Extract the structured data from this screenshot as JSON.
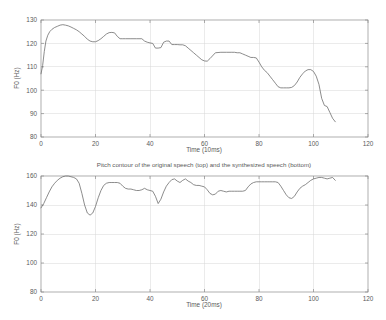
{
  "figure": {
    "title": "Pitch contour of the original speech (top) and the synthesized speech (bottom)",
    "background": "#ffffff",
    "line_color": "#6e6e6e",
    "axis_color": "#8c8c8c"
  },
  "chart_data": [
    {
      "type": "line",
      "id": "original-speech-pitch-contour",
      "title": "",
      "xlabel": "Time (10ms)",
      "ylabel": "F0 (Hz)",
      "xlim": [
        0,
        120
      ],
      "ylim": [
        80,
        130
      ],
      "xticks": [
        0,
        20,
        40,
        60,
        80,
        100,
        120
      ],
      "yticks": [
        80,
        90,
        100,
        110,
        120,
        130
      ],
      "grid": true,
      "legend": "none",
      "series": [
        {
          "name": "original speech F0",
          "x": [
            0,
            0.6,
            1.2,
            1.8,
            2.5,
            3.2,
            4,
            5,
            6,
            7,
            8,
            9,
            10,
            11,
            12,
            13,
            14,
            15,
            16,
            17,
            18,
            19,
            20,
            21,
            22,
            23,
            24,
            25,
            26,
            27,
            28,
            29,
            30,
            31,
            33,
            35,
            37,
            38,
            39,
            40,
            41,
            42,
            43,
            44,
            45,
            46,
            47,
            48,
            49,
            50,
            51,
            52,
            53,
            54,
            55,
            56,
            57,
            58,
            59,
            60,
            61,
            62,
            64,
            66,
            68,
            70,
            71,
            72,
            73,
            74,
            75,
            76,
            77,
            78,
            79,
            80,
            81,
            82,
            83,
            84,
            85,
            86,
            87,
            88,
            89,
            90,
            91,
            92,
            93,
            94,
            95,
            96,
            97,
            98,
            99,
            100,
            101,
            102,
            103,
            104,
            105,
            106,
            107,
            108
          ],
          "y": [
            107.0,
            110.5,
            116.5,
            121.0,
            123.5,
            125.0,
            126.0,
            126.8,
            127.3,
            127.8,
            128.0,
            127.8,
            127.5,
            127.0,
            126.4,
            125.8,
            125.0,
            124.0,
            123.0,
            121.8,
            121.0,
            120.7,
            120.7,
            121.2,
            122.0,
            123.0,
            124.0,
            124.6,
            124.7,
            124.5,
            123.0,
            122.0,
            122.0,
            122.0,
            122.0,
            122.0,
            122.0,
            121.0,
            120.5,
            120.2,
            120.0,
            118.0,
            118.0,
            118.2,
            120.5,
            121.0,
            121.0,
            119.5,
            119.5,
            119.5,
            119.4,
            119.4,
            119.0,
            118.0,
            117.0,
            116.0,
            115.0,
            114.0,
            113.0,
            112.5,
            112.4,
            113.5,
            116.0,
            116.2,
            116.2,
            116.2,
            116.2,
            116.0,
            116.0,
            115.5,
            115.0,
            114.5,
            114.0,
            114.0,
            113.8,
            112.0,
            110.0,
            108.5,
            107.5,
            106.0,
            104.5,
            103.0,
            101.5,
            101.0,
            101.0,
            101.0,
            101.0,
            101.2,
            102.0,
            103.5,
            105.5,
            107.0,
            108.2,
            108.8,
            108.8,
            108.0,
            106.0,
            102.5,
            96.5,
            93.5,
            93.0,
            90.5,
            88.0,
            86.5,
            86.0
          ]
        }
      ]
    },
    {
      "type": "line",
      "id": "synthesized-speech-pitch-contour",
      "title": "Pitch contour of the original speech (top) and the synthesized speech (bottom)",
      "xlabel": "Time (20ms)",
      "ylabel": "F0 (Hz)",
      "xlim": [
        0,
        120
      ],
      "ylim": [
        80,
        160
      ],
      "xticks": [
        0,
        20,
        40,
        60,
        80,
        100,
        120
      ],
      "yticks": [
        80,
        100,
        120,
        140,
        160
      ],
      "grid": true,
      "legend": "none",
      "series": [
        {
          "name": "synthesized speech F0",
          "x": [
            0,
            1,
            2,
            3,
            4,
            5,
            6,
            7,
            8,
            9,
            10,
            11,
            12,
            13,
            14,
            15,
            16,
            17,
            18,
            19,
            20,
            21,
            22,
            23,
            24,
            25,
            26,
            27,
            28,
            29,
            30,
            31,
            32,
            33,
            34,
            35,
            36,
            37,
            38,
            39,
            40,
            41,
            42,
            43,
            44,
            45,
            46,
            47,
            48,
            49,
            50,
            51,
            52,
            53,
            54,
            55,
            56,
            57,
            58,
            59,
            60,
            61,
            62,
            63,
            64,
            65,
            66,
            67,
            68,
            69,
            70,
            71,
            72,
            73,
            74,
            75,
            76,
            77,
            78,
            79,
            80,
            81,
            82,
            83,
            84,
            85,
            86,
            87,
            88,
            89,
            90,
            91,
            92,
            93,
            94,
            95,
            96,
            97,
            98,
            99,
            100,
            101,
            102,
            103,
            104,
            105,
            106,
            107,
            108
          ],
          "y": [
            138.0,
            141.0,
            145.0,
            149.0,
            152.5,
            155.0,
            157.0,
            158.5,
            159.5,
            160.0,
            160.0,
            159.5,
            159.0,
            158.0,
            155.0,
            148.0,
            140.0,
            134.5,
            133.0,
            134.5,
            139.0,
            145.0,
            150.0,
            153.5,
            155.0,
            155.5,
            155.5,
            155.5,
            155.5,
            155.0,
            153.0,
            151.5,
            151.0,
            151.0,
            150.5,
            150.0,
            150.0,
            150.5,
            151.5,
            150.5,
            150.0,
            149.5,
            146.0,
            141.0,
            144.0,
            149.0,
            153.0,
            155.5,
            157.5,
            158.0,
            156.5,
            155.5,
            157.0,
            158.0,
            156.5,
            155.5,
            154.0,
            153.5,
            153.5,
            153.0,
            152.5,
            150.5,
            148.0,
            147.0,
            147.5,
            149.5,
            150.0,
            149.5,
            149.0,
            149.5,
            149.5,
            149.5,
            149.5,
            149.5,
            149.5,
            150.0,
            152.5,
            154.5,
            155.5,
            156.0,
            156.0,
            156.0,
            156.0,
            156.0,
            156.0,
            156.0,
            156.0,
            155.5,
            153.0,
            150.0,
            147.0,
            145.0,
            144.5,
            146.0,
            149.0,
            151.5,
            153.0,
            154.0,
            155.5,
            157.0,
            158.0,
            158.5,
            159.0,
            159.0,
            158.5,
            158.0,
            158.5,
            159.0,
            157.0
          ]
        }
      ]
    }
  ]
}
